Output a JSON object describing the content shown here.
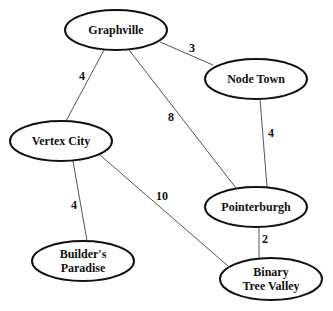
{
  "graph": {
    "nodes": [
      {
        "id": "graphville",
        "label_lines": [
          "Graphville"
        ],
        "cx": 116,
        "cy": 30,
        "rx": 51,
        "ry": 20
      },
      {
        "id": "node-town",
        "label_lines": [
          "Node Town"
        ],
        "cx": 256,
        "cy": 79,
        "rx": 51,
        "ry": 20
      },
      {
        "id": "vertex-city",
        "label_lines": [
          "Vertex City"
        ],
        "cx": 61,
        "cy": 141,
        "rx": 51,
        "ry": 20
      },
      {
        "id": "pointerburgh",
        "label_lines": [
          "Pointerburgh"
        ],
        "cx": 256,
        "cy": 207,
        "rx": 51,
        "ry": 20
      },
      {
        "id": "builders-paradise",
        "label_lines": [
          "Builder's",
          "Paradise"
        ],
        "cx": 83,
        "cy": 261,
        "rx": 51,
        "ry": 20
      },
      {
        "id": "binary-tree-valley",
        "label_lines": [
          "Binary",
          "Tree Valley"
        ],
        "cx": 271,
        "cy": 279,
        "rx": 51,
        "ry": 21
      }
    ],
    "edges": [
      {
        "from": "graphville",
        "to": "node-town",
        "weight": "3",
        "x1": 160,
        "y1": 42,
        "x2": 213,
        "y2": 65,
        "lx": 192,
        "ly": 52
      },
      {
        "from": "graphville",
        "to": "vertex-city",
        "weight": "4",
        "x1": 104,
        "y1": 50,
        "x2": 66,
        "y2": 121,
        "lx": 82,
        "ly": 80
      },
      {
        "from": "graphville",
        "to": "pointerburgh",
        "weight": "8",
        "x1": 129,
        "y1": 50,
        "x2": 236,
        "y2": 188,
        "lx": 171,
        "ly": 121
      },
      {
        "from": "node-town",
        "to": "pointerburgh",
        "weight": "4",
        "x1": 260,
        "y1": 99,
        "x2": 267,
        "y2": 187,
        "lx": 271,
        "ly": 137
      },
      {
        "from": "vertex-city",
        "to": "builders-paradise",
        "weight": "4",
        "x1": 73,
        "y1": 161,
        "x2": 87,
        "y2": 241,
        "lx": 74,
        "ly": 209
      },
      {
        "from": "vertex-city",
        "to": "binary-tree-valley",
        "weight": "10",
        "x1": 100,
        "y1": 155,
        "x2": 228,
        "y2": 266,
        "lx": 162,
        "ly": 200
      },
      {
        "from": "pointerburgh",
        "to": "binary-tree-valley",
        "weight": "2",
        "x1": 259,
        "y1": 227,
        "x2": 259,
        "y2": 259,
        "lx": 265,
        "ly": 243
      }
    ]
  }
}
